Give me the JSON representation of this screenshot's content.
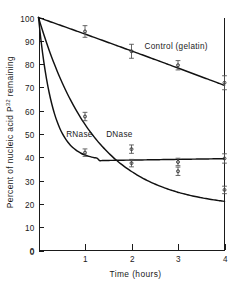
{
  "chart_data": {
    "type": "line",
    "title": "",
    "xlabel": "Time (hours)",
    "ylabel": "Percent of nucleic acid P32 remaining",
    "ylabel_main": "Percent of nucleic acid P",
    "ylabel_sup": "32",
    "ylabel_tail": " remaining",
    "xlim": [
      0,
      4
    ],
    "ylim": [
      0,
      100
    ],
    "xticks": [
      0,
      1,
      2,
      3,
      4
    ],
    "xtick_labels": [
      "0",
      "1",
      "2",
      "3",
      "4"
    ],
    "yticks": [
      0,
      10,
      20,
      30,
      40,
      50,
      60,
      70,
      80,
      90,
      100
    ],
    "ytick_labels": [
      "0",
      "10",
      "20",
      "30",
      "40",
      "50",
      "60",
      "70",
      "80",
      "90",
      "100"
    ],
    "grid": false,
    "legend_position": "inline-annotations",
    "axis_color": "#1a1a1a",
    "ink_color": "#111111",
    "background": "#ffffff",
    "x": [
      0,
      1,
      2,
      3,
      4
    ],
    "series": [
      {
        "name": "Control (gelatin)",
        "label": "Control (gelatin)",
        "values": [
          100,
          94,
          85.5,
          79.5,
          72
        ],
        "errors": [
          0,
          2.5,
          3,
          2,
          3
        ],
        "label_x": 2.28,
        "label_y": 86.5
      },
      {
        "name": "DNase",
        "label": "DNase",
        "values": [
          100,
          57.5,
          43.5,
          34,
          26
        ],
        "errors": [
          0,
          1.8,
          1.8,
          1.8,
          1.6
        ],
        "label_x": 1.74,
        "label_y": 48.5
      },
      {
        "name": "RNase",
        "label": "RNase",
        "values": [
          100,
          42,
          37.5,
          38,
          39.5
        ],
        "errors": [
          0,
          1.6,
          1.6,
          1.6,
          2.0
        ],
        "label_x": 0.88,
        "label_y": 48.5
      }
    ]
  }
}
